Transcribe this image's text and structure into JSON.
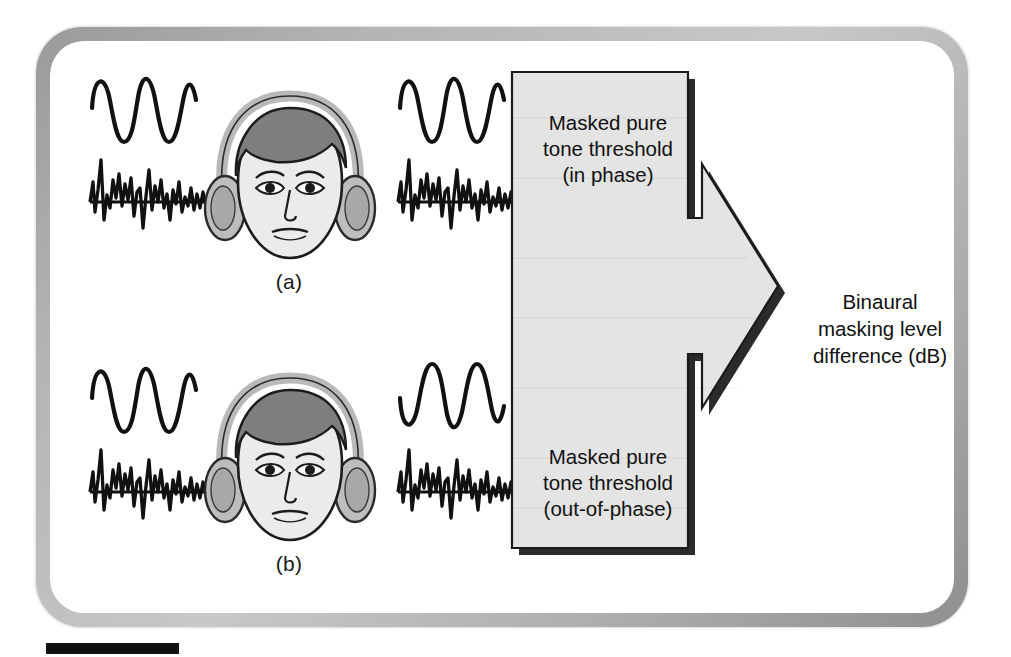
{
  "figure": {
    "kind": "binaural-masking-level-difference-diagram",
    "panels": [
      {
        "id": "a",
        "label": "(a)",
        "left_ear": {
          "tone": "sine-wave-3-cycles",
          "noise": "broadband-noise"
        },
        "right_ear": {
          "tone": "sine-wave-3-cycles-in-phase",
          "noise": "broadband-noise"
        },
        "condition": "in phase"
      },
      {
        "id": "b",
        "label": "(b)",
        "left_ear": {
          "tone": "sine-wave-3-cycles",
          "noise": "broadband-noise"
        },
        "right_ear": {
          "tone": "sine-wave-3-cycles-inverted",
          "noise": "broadband-noise"
        },
        "condition": "out-of-phase"
      }
    ],
    "boxes": {
      "top": {
        "line1": "Masked pure",
        "line2": "tone threshold",
        "line3": "(in phase)"
      },
      "bottom": {
        "line1": "Masked pure",
        "line2": "tone threshold",
        "line3": "(out-of-phase)"
      }
    },
    "result": {
      "line1": "Binaural",
      "line2": "masking level",
      "line3": "difference (dB)"
    },
    "colors": {
      "frame_border_light": "#c8c8c8",
      "frame_border_dark": "#8f8f8f",
      "box_fill": "#e3e3e3",
      "box_shadow": "#2b2b2b",
      "stroke": "#111111",
      "hair": "#7c7c7c",
      "skin": "#e8e8e8",
      "headphone": "#b8b8b8",
      "scale_bar": "#111111"
    },
    "scale_bar": {
      "name": "scale-bar"
    }
  }
}
